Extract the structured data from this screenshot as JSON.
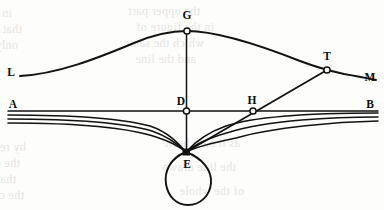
{
  "figure": {
    "background_color": "#fdfdfc",
    "ink_color": "#121212",
    "width": 384,
    "height": 210
  },
  "labels": {
    "L": "L",
    "G": "G",
    "T": "T",
    "M": "M",
    "A": "A",
    "D": "D",
    "H": "H",
    "B": "B",
    "E": "E"
  },
  "points": {
    "L": {
      "label": "L",
      "x": 15,
      "y": 72,
      "marker": "none"
    },
    "G": {
      "label": "G",
      "x": 187,
      "y": 31,
      "marker": "open-circle"
    },
    "T": {
      "label": "T",
      "x": 327,
      "y": 70,
      "marker": "open-circle"
    },
    "M": {
      "label": "M",
      "x": 369,
      "y": 78,
      "marker": "none"
    },
    "A": {
      "label": "A",
      "x": 13,
      "y": 111,
      "marker": "none"
    },
    "D": {
      "label": "D",
      "x": 186,
      "y": 111,
      "marker": "open-circle"
    },
    "H": {
      "label": "H",
      "x": 253,
      "y": 111,
      "marker": "open-circle"
    },
    "B": {
      "label": "B",
      "x": 371,
      "y": 111,
      "marker": "none"
    },
    "E": {
      "label": "E",
      "x": 186,
      "y": 152,
      "marker": "solid-square"
    }
  },
  "ghost_text": {
    "note": "faint show-through of printed text from the reverse side of the page",
    "lines": [
      {
        "text": "in the middle of",
        "x": 12,
        "y": 6
      },
      {
        "text": "that motion was",
        "x": 22,
        "y": 22
      },
      {
        "text": "only the",
        "x": 18,
        "y": 38
      },
      {
        "text": "the upper part",
        "x": 200,
        "y": 4
      },
      {
        "text": "in the figure of",
        "x": 214,
        "y": 20
      },
      {
        "text": "which the same",
        "x": 204,
        "y": 36
      },
      {
        "text": "and the line",
        "x": 196,
        "y": 52
      },
      {
        "text": "by reason of",
        "x": 26,
        "y": 140
      },
      {
        "text": "the distance",
        "x": 20,
        "y": 156
      },
      {
        "text": "that are found",
        "x": 16,
        "y": 172
      },
      {
        "text": "the circle and",
        "x": 24,
        "y": 188
      },
      {
        "text": "as it hath been",
        "x": 240,
        "y": 136
      },
      {
        "text": "the line drawn",
        "x": 236,
        "y": 160
      },
      {
        "text": "of the whole",
        "x": 244,
        "y": 184
      }
    ]
  },
  "elements": {
    "baseline": {
      "name": "line-AB",
      "from": "A",
      "to": "B",
      "description": "straight horizontal datum line from A to B passing through D and H"
    },
    "vertical": {
      "name": "segment-DE",
      "from": "D",
      "to": "E",
      "description": "vertical segment from G through D down to the cusp at E"
    },
    "arc": {
      "name": "curve-LGM",
      "description": "smooth arch rising from L to the apex G and falling through T to M"
    },
    "ray": {
      "name": "segment-ET",
      "description": "straight line from the cusp E upward through H to the tangency point T"
    },
    "band": {
      "name": "cycloid-family",
      "count": 3,
      "description": "three nearly-horizontal curves on each side that bend down and converge at the cusp E"
    },
    "loop": {
      "name": "loop-at-E",
      "description": "teardrop-shaped closed loop hanging below the cusp point E"
    }
  }
}
